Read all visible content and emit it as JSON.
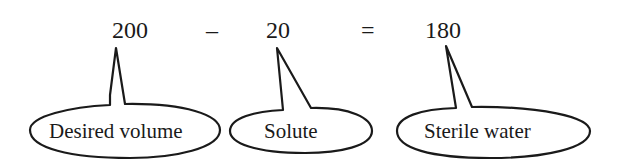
{
  "equation": {
    "terms": [
      {
        "id": "desired-volume",
        "value": "200"
      },
      {
        "id": "solute",
        "value": "20"
      },
      {
        "id": "sterile-water",
        "value": "180"
      }
    ],
    "operators": {
      "minus": "–",
      "equals": "="
    }
  },
  "labels": {
    "desired_volume": "Desired volume",
    "solute": "Solute",
    "sterile_water": "Sterile water"
  }
}
